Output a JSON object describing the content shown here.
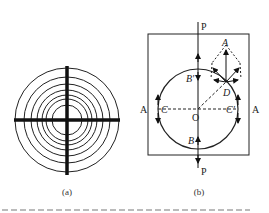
{
  "figure": {
    "panel_a": {
      "caption": "(a)",
      "rings": 7,
      "description": "concentric circles with cross-hair"
    },
    "panel_b": {
      "caption": "(b)",
      "labels": {
        "top_force": "P",
        "bottom_force": "P",
        "left_section": "A",
        "right_section": "A",
        "left_point": "C",
        "right_point": "C'",
        "center": "O",
        "top_point": "B'",
        "bottom_point": "B",
        "point_d": "D",
        "point_a": "A"
      }
    },
    "bottom_caption": "图 ... (cropped)"
  }
}
